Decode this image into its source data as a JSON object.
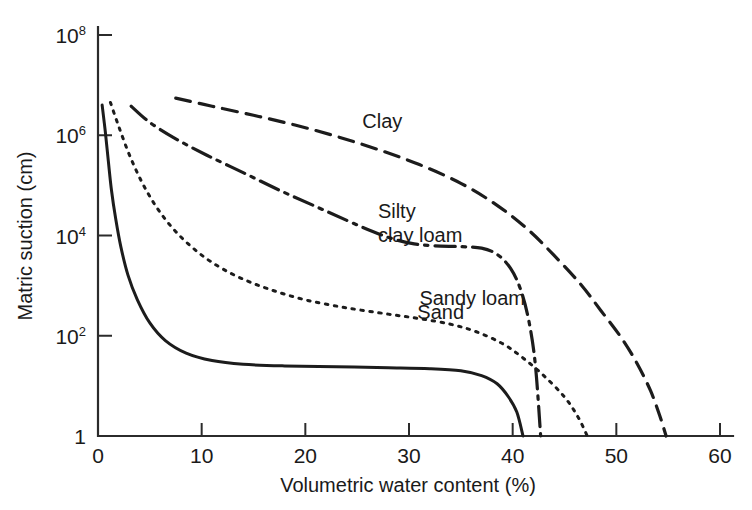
{
  "figure": {
    "background": "#ffffff",
    "ink_color": "#1a1a1a"
  },
  "chart_data": {
    "type": "line",
    "title": "",
    "xlabel": "Volumetric water content (%)",
    "ylabel": "Matric suction (cm)",
    "xlim": [
      0,
      60
    ],
    "ylim": [
      1,
      100000000
    ],
    "yscale": "log",
    "grid": false,
    "legend_position": "inline-annotations",
    "x_ticks": [
      0,
      10,
      20,
      30,
      40,
      50,
      60
    ],
    "x_tick_labels": [
      "0",
      "10",
      "20",
      "30",
      "40",
      "50",
      "60"
    ],
    "y_ticks": [
      1,
      100,
      10000,
      1000000,
      100000000
    ],
    "y_tick_labels": [
      "1",
      "10²",
      "10⁴",
      "10⁶",
      "10⁸"
    ],
    "y_tick_bases": [
      "1",
      "10",
      "10",
      "10",
      "10"
    ],
    "y_tick_exponents": [
      "",
      "2",
      "4",
      "6",
      "8"
    ],
    "series": [
      {
        "name": "Sand",
        "linestyle": "solid",
        "label_text": "Sand",
        "label_x": 30.8,
        "label_y": 220,
        "points": [
          [
            0.4,
            4000000
          ],
          [
            0.7,
            1200000
          ],
          [
            1.0,
            300000
          ],
          [
            1.3,
            80000
          ],
          [
            1.7,
            22000
          ],
          [
            2.2,
            6000
          ],
          [
            2.9,
            1600
          ],
          [
            3.8,
            520
          ],
          [
            5.0,
            180
          ],
          [
            6.5,
            80
          ],
          [
            8.5,
            45
          ],
          [
            11.0,
            32
          ],
          [
            14.0,
            27
          ],
          [
            18.0,
            25
          ],
          [
            23.0,
            24
          ],
          [
            28.0,
            23
          ],
          [
            32.0,
            22
          ],
          [
            35.0,
            20
          ],
          [
            37.0,
            16
          ],
          [
            38.5,
            11
          ],
          [
            39.6,
            6
          ],
          [
            40.4,
            3.0
          ],
          [
            41.0,
            1.0
          ]
        ]
      },
      {
        "name": "Sandy loam",
        "linestyle": "dotted",
        "label_text": "Sandy loam",
        "label_x": 31.0,
        "label_y": 420,
        "points": [
          [
            1.2,
            4500000
          ],
          [
            2.0,
            1500000
          ],
          [
            3.0,
            420000
          ],
          [
            4.2,
            120000
          ],
          [
            5.6,
            38000
          ],
          [
            7.2,
            14000
          ],
          [
            9.0,
            6000
          ],
          [
            11.0,
            2900
          ],
          [
            13.5,
            1500
          ],
          [
            16.5,
            850
          ],
          [
            20.0,
            520
          ],
          [
            24.0,
            360
          ],
          [
            28.0,
            270
          ],
          [
            31.0,
            220
          ],
          [
            34.0,
            170
          ],
          [
            36.5,
            120
          ],
          [
            39.0,
            70
          ],
          [
            41.0,
            36
          ],
          [
            43.0,
            16
          ],
          [
            45.0,
            6
          ],
          [
            46.3,
            2.4
          ],
          [
            47.2,
            1.0
          ]
        ]
      },
      {
        "name": "Silty clay loam",
        "linestyle": "dash-dot",
        "label_text_line1": "Silty",
        "label_text_line2": "clay loam",
        "label_x": 27.0,
        "label_y": 22000,
        "points": [
          [
            3.2,
            3800000
          ],
          [
            5.0,
            1800000
          ],
          [
            7.5,
            850000
          ],
          [
            10.5,
            400000
          ],
          [
            14.0,
            180000
          ],
          [
            17.5,
            80000
          ],
          [
            21.0,
            38000
          ],
          [
            24.0,
            20000
          ],
          [
            26.5,
            12000
          ],
          [
            28.5,
            8500
          ],
          [
            30.5,
            6800
          ],
          [
            32.5,
            6200
          ],
          [
            35.0,
            6000
          ],
          [
            37.0,
            5600
          ],
          [
            38.5,
            4200
          ],
          [
            39.8,
            2200
          ],
          [
            40.8,
            800
          ],
          [
            41.6,
            180
          ],
          [
            42.2,
            25
          ],
          [
            42.7,
            1.0
          ]
        ]
      },
      {
        "name": "Clay",
        "linestyle": "dashed",
        "label_text": "Clay",
        "label_x": 25.5,
        "label_y": 1400000,
        "points": [
          [
            7.5,
            5500000
          ],
          [
            11.0,
            3800000
          ],
          [
            15.0,
            2500000
          ],
          [
            19.0,
            1600000
          ],
          [
            23.0,
            950000
          ],
          [
            27.0,
            520000
          ],
          [
            31.0,
            260000
          ],
          [
            35.0,
            110000
          ],
          [
            38.5,
            40000
          ],
          [
            41.5,
            13000
          ],
          [
            44.0,
            4000
          ],
          [
            46.5,
            1100
          ],
          [
            48.5,
            320
          ],
          [
            50.5,
            90
          ],
          [
            52.0,
            28
          ],
          [
            53.3,
            8
          ],
          [
            54.2,
            2.5
          ],
          [
            54.8,
            1.0
          ]
        ]
      }
    ]
  },
  "annotations": {
    "clay": "Clay",
    "silty_clay_loam_line1": "Silty",
    "silty_clay_loam_line2": "clay loam",
    "sandy_loam": "Sandy loam",
    "sand": "Sand"
  }
}
